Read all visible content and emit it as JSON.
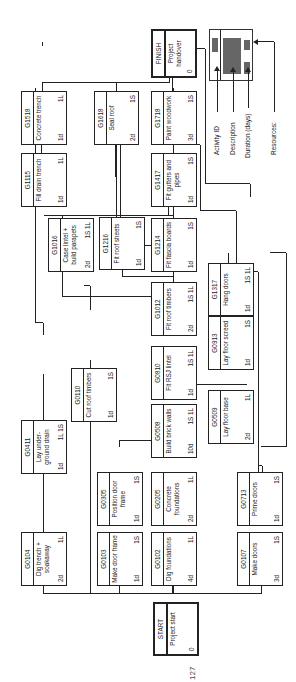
{
  "diagram": {
    "type": "precedence-network",
    "orientation": "rotated-90-ccw",
    "nodes": {
      "start": {
        "id": "START",
        "desc": "Project start",
        "dur": "0",
        "res": ""
      },
      "g0104": {
        "id": "G0104",
        "desc": "Dig trench + soakaway",
        "dur": "2d",
        "res": "1L"
      },
      "g0103": {
        "id": "G0103",
        "desc": "Make door frame",
        "dur": "1d",
        "res": "1S"
      },
      "g0102": {
        "id": "G0102",
        "desc": "Dig foundations",
        "dur": "4d",
        "res": "1L"
      },
      "g0107": {
        "id": "G0107",
        "desc": "Make doors",
        "dur": "3d",
        "res": "1S"
      },
      "g0305": {
        "id": "G0305",
        "desc": "Position door frame",
        "dur": "1d",
        "res": "1S"
      },
      "g0205": {
        "id": "G0205",
        "desc": "Concrete foundations",
        "dur": "2d",
        "res": "1L"
      },
      "g0713": {
        "id": "G0713",
        "desc": "Prime doors",
        "dur": "1d",
        "res": "1S"
      },
      "g0411": {
        "id": "G0411",
        "desc": "Lay under-ground drain",
        "dur": "1d",
        "res": "1L 1S"
      },
      "g0110": {
        "id": "G0110",
        "desc": "Cut roof timbers",
        "dur": "1d",
        "res": "1S"
      },
      "g0508": {
        "id": "G0508",
        "desc": "Build brick walls",
        "dur": "10d",
        "res": "1S 1L"
      },
      "g0509": {
        "id": "G0509",
        "desc": "Lay floor base",
        "dur": "2d",
        "res": "1L"
      },
      "g0810": {
        "id": "G0810",
        "desc": "Fit RSJ lintel",
        "dur": "1d",
        "res": "1S 1L"
      },
      "g0913": {
        "id": "G0913",
        "desc": "Lay floor screed",
        "dur": "1d",
        "res": "1S"
      },
      "g1012": {
        "id": "G1012",
        "desc": "Fit roof timbers",
        "dur": "2d",
        "res": "1S 1L"
      },
      "g1016": {
        "id": "G1016",
        "desc": "Case lintel + build parapets",
        "dur": "2d",
        "res": "1S 1L"
      },
      "g1216": {
        "id": "G1216",
        "desc": "Fit roof sheets",
        "dur": "1d",
        "res": "1S"
      },
      "g1214": {
        "id": "G1214",
        "desc": "Fit fascia boards",
        "dur": "1d",
        "res": "1S"
      },
      "g1317": {
        "id": "G1317",
        "desc": "Hang doors",
        "dur": "1d",
        "res": "1S 1L"
      },
      "g1115": {
        "id": "G1115",
        "desc": "Fill drain trench",
        "dur": "1d",
        "res": "1L"
      },
      "g1417": {
        "id": "G1417",
        "desc": "Fit gutters and pipes",
        "dur": "1d",
        "res": "1S"
      },
      "g1518": {
        "id": "G1518",
        "desc": "Concrete trench",
        "dur": "1d",
        "res": "1L"
      },
      "g1618": {
        "id": "G1618",
        "desc": "Seal roof",
        "dur": "2d",
        "res": "1S"
      },
      "g1718": {
        "id": "G1718",
        "desc": "Paint woodwork",
        "dur": "3d",
        "res": "1S"
      },
      "finish": {
        "id": "FINISH",
        "desc": "Project handover",
        "dur": "0",
        "res": ""
      }
    },
    "legend": {
      "activity_id": "Activity ID",
      "description": "Description",
      "duration": "Duration (days)",
      "resources": "Resources:"
    },
    "page_number": "127"
  }
}
